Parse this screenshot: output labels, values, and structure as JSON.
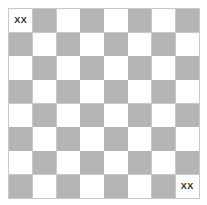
{
  "board": {
    "name": "checkerboard",
    "rows": 8,
    "columns": 8,
    "light_color": "#ffffff",
    "dark_color": "#b5b5b5",
    "border_color": "#c9c9c9",
    "background_color": "#ffffff",
    "label_color": "#2b2b2b",
    "top_left_shade": "light",
    "labels": [
      {
        "row": 0,
        "col": 0,
        "text": "XX"
      },
      {
        "row": 7,
        "col": 7,
        "text": "XX"
      }
    ],
    "cells": [
      [
        {
          "shade": "light",
          "label": "XX"
        },
        {
          "shade": "dark",
          "label": ""
        },
        {
          "shade": "light",
          "label": ""
        },
        {
          "shade": "dark",
          "label": ""
        },
        {
          "shade": "light",
          "label": ""
        },
        {
          "shade": "dark",
          "label": ""
        },
        {
          "shade": "light",
          "label": ""
        },
        {
          "shade": "dark",
          "label": ""
        }
      ],
      [
        {
          "shade": "dark",
          "label": ""
        },
        {
          "shade": "light",
          "label": ""
        },
        {
          "shade": "dark",
          "label": ""
        },
        {
          "shade": "light",
          "label": ""
        },
        {
          "shade": "dark",
          "label": ""
        },
        {
          "shade": "light",
          "label": ""
        },
        {
          "shade": "dark",
          "label": ""
        },
        {
          "shade": "light",
          "label": ""
        }
      ],
      [
        {
          "shade": "light",
          "label": ""
        },
        {
          "shade": "dark",
          "label": ""
        },
        {
          "shade": "light",
          "label": ""
        },
        {
          "shade": "dark",
          "label": ""
        },
        {
          "shade": "light",
          "label": ""
        },
        {
          "shade": "dark",
          "label": ""
        },
        {
          "shade": "light",
          "label": ""
        },
        {
          "shade": "dark",
          "label": ""
        }
      ],
      [
        {
          "shade": "dark",
          "label": ""
        },
        {
          "shade": "light",
          "label": ""
        },
        {
          "shade": "dark",
          "label": ""
        },
        {
          "shade": "light",
          "label": ""
        },
        {
          "shade": "dark",
          "label": ""
        },
        {
          "shade": "light",
          "label": ""
        },
        {
          "shade": "dark",
          "label": ""
        },
        {
          "shade": "light",
          "label": ""
        }
      ],
      [
        {
          "shade": "light",
          "label": ""
        },
        {
          "shade": "dark",
          "label": ""
        },
        {
          "shade": "light",
          "label": ""
        },
        {
          "shade": "dark",
          "label": ""
        },
        {
          "shade": "light",
          "label": ""
        },
        {
          "shade": "dark",
          "label": ""
        },
        {
          "shade": "light",
          "label": ""
        },
        {
          "shade": "dark",
          "label": ""
        }
      ],
      [
        {
          "shade": "dark",
          "label": ""
        },
        {
          "shade": "light",
          "label": ""
        },
        {
          "shade": "dark",
          "label": ""
        },
        {
          "shade": "light",
          "label": ""
        },
        {
          "shade": "dark",
          "label": ""
        },
        {
          "shade": "light",
          "label": ""
        },
        {
          "shade": "dark",
          "label": ""
        },
        {
          "shade": "light",
          "label": ""
        }
      ],
      [
        {
          "shade": "light",
          "label": ""
        },
        {
          "shade": "dark",
          "label": ""
        },
        {
          "shade": "light",
          "label": ""
        },
        {
          "shade": "dark",
          "label": ""
        },
        {
          "shade": "light",
          "label": ""
        },
        {
          "shade": "dark",
          "label": ""
        },
        {
          "shade": "light",
          "label": ""
        },
        {
          "shade": "dark",
          "label": ""
        }
      ],
      [
        {
          "shade": "dark",
          "label": ""
        },
        {
          "shade": "light",
          "label": ""
        },
        {
          "shade": "dark",
          "label": ""
        },
        {
          "shade": "light",
          "label": ""
        },
        {
          "shade": "dark",
          "label": ""
        },
        {
          "shade": "light",
          "label": ""
        },
        {
          "shade": "dark",
          "label": ""
        },
        {
          "shade": "light",
          "label": "XX"
        }
      ]
    ]
  }
}
